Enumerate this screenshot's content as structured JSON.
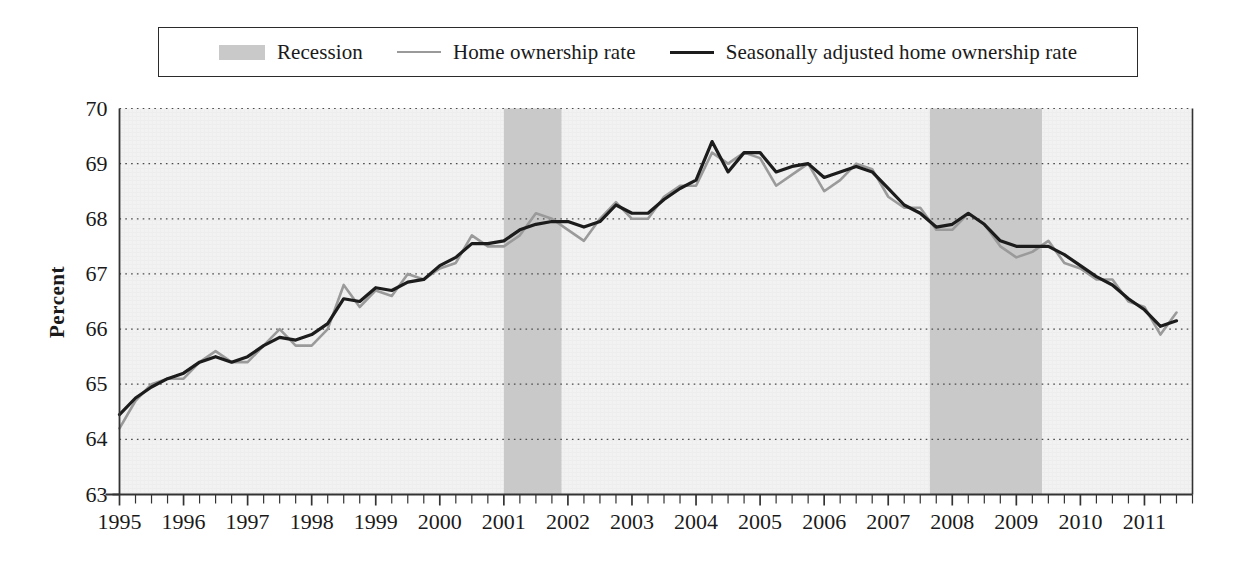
{
  "legend": {
    "entries": [
      {
        "label": "Recession",
        "kind": "band",
        "color": "#c9c9c9"
      },
      {
        "label": "Home ownership rate",
        "kind": "line",
        "color": "#9a9a9a"
      },
      {
        "label": "Seasonally adjusted home ownership rate",
        "kind": "line",
        "color": "#1c1c1c"
      }
    ]
  },
  "axes": {
    "ylabel": "Percent",
    "xlabel": "",
    "ytick_labels": [
      "70",
      "69",
      "68",
      "67",
      "66",
      "65",
      "64",
      "63"
    ],
    "xtick_labels": [
      "1995",
      "1996",
      "1997",
      "1998",
      "1999",
      "2000",
      "2001",
      "2002",
      "2003",
      "2004",
      "2005",
      "2006",
      "2007",
      "2008",
      "2009",
      "2010",
      "2011"
    ]
  },
  "chart_data": {
    "type": "line",
    "title": "",
    "xlabel": "",
    "ylabel": "Percent",
    "ylim": [
      63,
      70
    ],
    "xlim": [
      1995.0,
      2011.75
    ],
    "grid": true,
    "gridlines_y": [
      64,
      65,
      66,
      67,
      68,
      69,
      70
    ],
    "legend_position": "top-outside",
    "x": [
      1995.0,
      1995.25,
      1995.5,
      1995.75,
      1996.0,
      1996.25,
      1996.5,
      1996.75,
      1997.0,
      1997.25,
      1997.5,
      1997.75,
      1998.0,
      1998.25,
      1998.5,
      1998.75,
      1999.0,
      1999.25,
      1999.5,
      1999.75,
      2000.0,
      2000.25,
      2000.5,
      2000.75,
      2001.0,
      2001.25,
      2001.5,
      2001.75,
      2002.0,
      2002.25,
      2002.5,
      2002.75,
      2003.0,
      2003.25,
      2003.5,
      2003.75,
      2004.0,
      2004.25,
      2004.5,
      2004.75,
      2005.0,
      2005.25,
      2005.5,
      2005.75,
      2006.0,
      2006.25,
      2006.5,
      2006.75,
      2007.0,
      2007.25,
      2007.5,
      2007.75,
      2008.0,
      2008.25,
      2008.5,
      2008.75,
      2009.0,
      2009.25,
      2009.5,
      2009.75,
      2010.0,
      2010.25,
      2010.5,
      2010.75,
      2011.0,
      2011.25,
      2011.5
    ],
    "xtick_years": [
      "1995",
      "1996",
      "1997",
      "1998",
      "1999",
      "2000",
      "2001",
      "2002",
      "2003",
      "2004",
      "2005",
      "2006",
      "2007",
      "2008",
      "2009",
      "2010",
      "2011"
    ],
    "series": [
      {
        "name": "Home ownership rate",
        "color": "#9a9a9a",
        "width": 2.6,
        "values": [
          64.2,
          64.7,
          65.0,
          65.1,
          65.1,
          65.4,
          65.6,
          65.4,
          65.4,
          65.7,
          66.0,
          65.7,
          65.7,
          66.0,
          66.8,
          66.4,
          66.7,
          66.6,
          67.0,
          66.9,
          67.1,
          67.2,
          67.7,
          67.5,
          67.5,
          67.7,
          68.1,
          68.0,
          67.8,
          67.6,
          68.0,
          68.3,
          68.0,
          68.0,
          68.4,
          68.6,
          68.6,
          69.2,
          69.0,
          69.2,
          69.1,
          68.6,
          68.8,
          69.0,
          68.5,
          68.7,
          69.0,
          68.9,
          68.4,
          68.2,
          68.2,
          67.8,
          67.8,
          68.1,
          67.9,
          67.5,
          67.3,
          67.4,
          67.6,
          67.2,
          67.1,
          66.9,
          66.9,
          66.5,
          66.4,
          65.9,
          66.3
        ]
      },
      {
        "name": "Seasonally adjusted home ownership rate",
        "color": "#1c1c1c",
        "width": 3.2,
        "values": [
          64.45,
          64.75,
          64.95,
          65.1,
          65.2,
          65.4,
          65.5,
          65.4,
          65.5,
          65.7,
          65.85,
          65.8,
          65.9,
          66.1,
          66.55,
          66.5,
          66.75,
          66.7,
          66.85,
          66.9,
          67.15,
          67.3,
          67.55,
          67.55,
          67.6,
          67.8,
          67.9,
          67.95,
          67.95,
          67.85,
          67.95,
          68.25,
          68.1,
          68.1,
          68.35,
          68.55,
          68.7,
          69.4,
          68.85,
          69.2,
          69.2,
          68.85,
          68.95,
          69.0,
          68.75,
          68.85,
          68.95,
          68.85,
          68.55,
          68.25,
          68.1,
          67.85,
          67.9,
          68.1,
          67.9,
          67.6,
          67.5,
          67.5,
          67.5,
          67.35,
          67.15,
          66.95,
          66.8,
          66.55,
          66.35,
          66.05,
          66.15
        ]
      }
    ],
    "recession_bands": [
      {
        "label": "Recession",
        "start": 2001.0,
        "end": 2001.9,
        "color": "#c9c9c9"
      },
      {
        "label": "Recession",
        "start": 2007.65,
        "end": 2009.4,
        "color": "#c9c9c9"
      }
    ]
  }
}
